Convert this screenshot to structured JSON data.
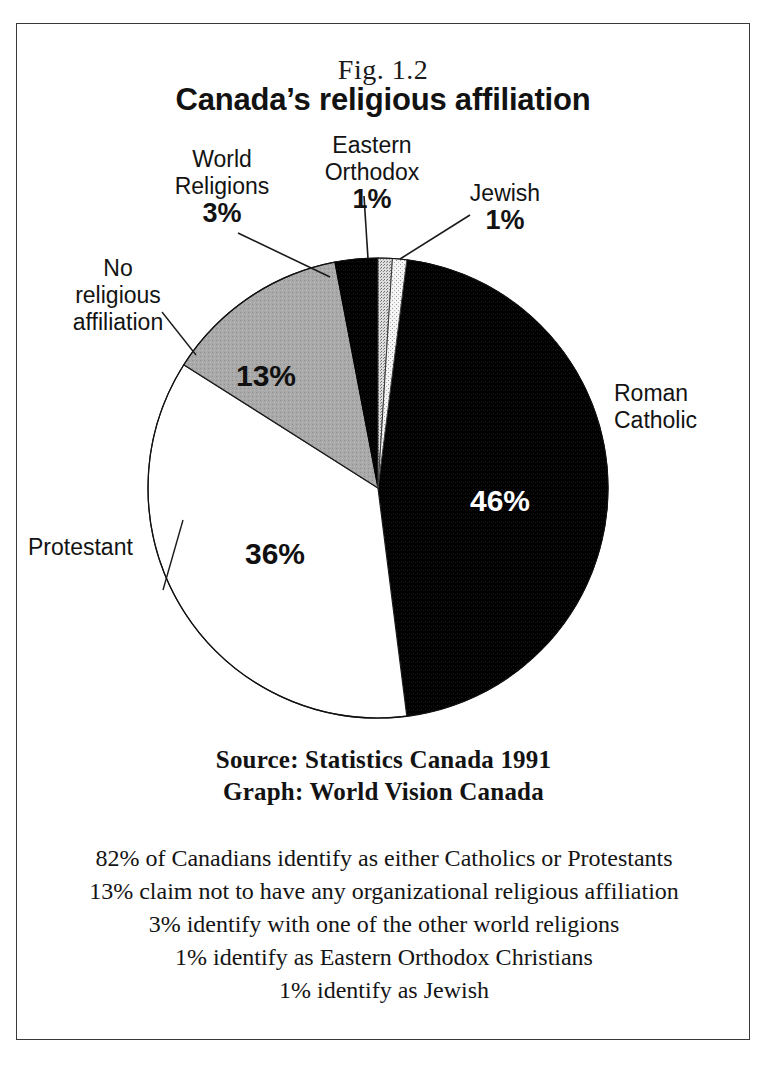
{
  "figure": {
    "number": "Fig. 1.2",
    "title": "Canada’s religious affiliation"
  },
  "labels": {
    "world_religions": "World\nReligions",
    "world_religions_l1": "World",
    "world_religions_l2": "Religions",
    "world_religions_pct": "3%",
    "eastern_orthodox_l1": "Eastern",
    "eastern_orthodox_l2": "Orthodox",
    "eastern_orthodox_pct": "1%",
    "jewish": "Jewish",
    "jewish_pct": "1%",
    "no_affiliation_l1": "No",
    "no_affiliation_l2": "religious",
    "no_affiliation_l3": "affiliation",
    "no_affiliation_pct": "13%",
    "protestant": "Protestant",
    "protestant_pct": "36%",
    "roman_catholic_l1": "Roman",
    "roman_catholic_l2": "Catholic",
    "roman_catholic_pct": "46%"
  },
  "source": {
    "line1": "Source: Statistics Canada 1991",
    "line2": "Graph: World Vision Canada"
  },
  "summary": {
    "lines": [
      "82% of Canadians identify as either Catholics or Protestants",
      "13% claim not to have any organizational religious affiliation",
      "3% identify with one of the other world religions",
      "1% identify as Eastern Orthodox Christians",
      "1% identify as Jewish"
    ],
    "line0": "82% of Canadians identify as either Catholics or Protestants",
    "line1": "13% claim not to have any organizational religious affiliation",
    "line2": "3% identify with one of the other world religions",
    "line3": "1% identify as Eastern Orthodox Christians",
    "line4": "1% identify as Jewish"
  },
  "colors": {
    "black_slice": "#000000",
    "white_slice": "#ffffff",
    "gray_slice": "#a8a8a8",
    "light_gray_slice": "#d0d0d0",
    "pale_slice": "#efefef",
    "outline": "#000000",
    "frame": "#3a3a3a",
    "text": "#131313"
  },
  "chart_data": {
    "type": "pie",
    "title": "Canada’s religious affiliation",
    "subtitle": "Fig. 1.2",
    "unit": "percent",
    "total": 100,
    "start_angle_deg": 0,
    "direction": "clockwise",
    "legend": "labels with leader lines around pie",
    "categories": [
      "Eastern Orthodox",
      "Jewish",
      "Roman Catholic",
      "Protestant",
      "No religious affiliation",
      "World Religions"
    ],
    "values": [
      1,
      1,
      46,
      36,
      13,
      3
    ],
    "slices": [
      {
        "label": "Eastern Orthodox",
        "value": 1,
        "display": "1%",
        "fill": "#d0d0d0",
        "pattern": "stipple",
        "label_color": "#131313"
      },
      {
        "label": "Jewish",
        "value": 1,
        "display": "1%",
        "fill": "#efefef",
        "pattern": "stipple-light",
        "label_color": "#131313"
      },
      {
        "label": "Roman Catholic",
        "value": 46,
        "display": "46%",
        "fill": "#000000",
        "pattern": "solid",
        "label_color": "#ffffff"
      },
      {
        "label": "Protestant",
        "value": 36,
        "display": "36%",
        "fill": "#ffffff",
        "pattern": "solid",
        "label_color": "#101010"
      },
      {
        "label": "No religious affiliation",
        "value": 13,
        "display": "13%",
        "fill": "#a8a8a8",
        "pattern": "solid",
        "label_color": "#101010"
      },
      {
        "label": "World Religions",
        "value": 3,
        "display": "3%",
        "fill": "#000000",
        "pattern": "solid",
        "label_color": "#131313"
      }
    ],
    "source": "Source: Statistics Canada 1991",
    "graph_credit": "Graph: World Vision Canada"
  }
}
